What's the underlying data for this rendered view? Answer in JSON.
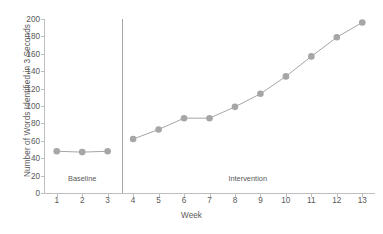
{
  "chart_data": {
    "type": "line",
    "title": "",
    "subtitle": "",
    "xlabel": "Week",
    "ylabel": "Number of Words Identified in 3 Seconds",
    "x": [
      1,
      2,
      3,
      4,
      5,
      6,
      7,
      8,
      9,
      10,
      11,
      12,
      13
    ],
    "xtick_labels": [
      "1",
      "2",
      "3",
      "4",
      "5",
      "6",
      "7",
      "8",
      "9",
      "10",
      "11",
      "12",
      "13"
    ],
    "ytick_labels": [
      "0",
      "20",
      "40",
      "60",
      "80",
      "100",
      "120",
      "140",
      "160",
      "180",
      "200"
    ],
    "yticks": [
      0,
      20,
      40,
      60,
      80,
      100,
      120,
      140,
      160,
      180,
      200
    ],
    "ylim": [
      0,
      200
    ],
    "xlim": [
      0.5,
      13.5
    ],
    "grid": false,
    "legend": "none",
    "series": [
      {
        "name": "Baseline",
        "x": [
          1,
          2,
          3
        ],
        "values": [
          48,
          47,
          48
        ],
        "color": "#a6a6a6",
        "marker": "circle"
      },
      {
        "name": "Intervention",
        "x": [
          4,
          5,
          6,
          7,
          8,
          9,
          10,
          11,
          12,
          13
        ],
        "values": [
          62,
          73,
          86,
          86,
          99,
          114,
          134,
          157,
          179,
          196
        ],
        "color": "#a6a6a6",
        "marker": "circle"
      }
    ],
    "annotations": [
      {
        "text": "Baseline",
        "x": 2,
        "y": 16,
        "name": "phase-label-baseline"
      },
      {
        "text": "Intervention",
        "x": 8.5,
        "y": 16,
        "name": "phase-label-intervention"
      }
    ],
    "phase_divider": {
      "x": 3.55,
      "label": "phase-change-line"
    },
    "colors": {
      "series": "#a6a6a6",
      "axis": "#bfbfbf",
      "text": "#595959",
      "divider": "#a6a6a6",
      "background": "#ffffff"
    }
  }
}
